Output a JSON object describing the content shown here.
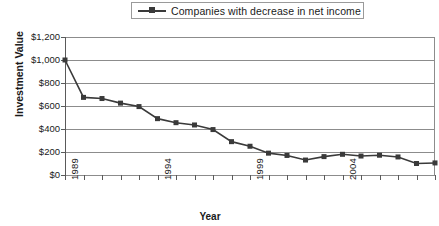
{
  "legend": {
    "entries": [
      {
        "label": "Companies with decrease in net income",
        "color": "#3a3a3a",
        "marker": "square"
      }
    ]
  },
  "axes": {
    "y_title": "Investment Value",
    "x_title": "Year",
    "y_tick_labels": [
      "$1,200",
      "$1,000",
      "$800",
      "$600",
      "$400",
      "$200",
      "$0"
    ],
    "x_tick_labels": [
      "1989",
      "1994",
      "1999",
      "2004",
      "2009"
    ]
  },
  "chart_data": {
    "type": "line",
    "title": "",
    "subtitle": "",
    "xlabel": "Year",
    "ylabel": "Investment Value",
    "xlim": [
      1989,
      2009
    ],
    "ylim": [
      0,
      1200
    ],
    "ytick_interval": 200,
    "grid": true,
    "legend_position": "top-center",
    "line_color": "#3a3a3a",
    "marker": "square",
    "categories": [
      1989,
      1990,
      1991,
      1992,
      1993,
      1994,
      1995,
      1996,
      1997,
      1998,
      1999,
      2000,
      2001,
      2002,
      2003,
      2004,
      2005,
      2006,
      2007,
      2008,
      2009
    ],
    "series": [
      {
        "name": "Companies with decrease in net income",
        "values": [
          1000,
          675,
          665,
          625,
          595,
          490,
          455,
          435,
          395,
          290,
          250,
          190,
          170,
          130,
          160,
          180,
          165,
          172,
          157,
          100,
          105
        ]
      }
    ]
  }
}
